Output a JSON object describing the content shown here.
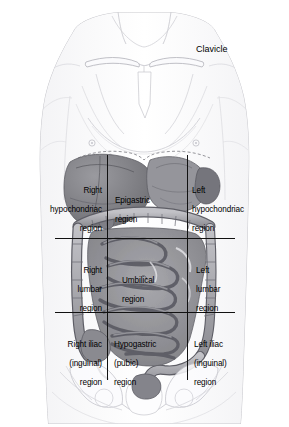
{
  "annotations": {
    "clavicle": "Clavicle"
  },
  "regions": [
    {
      "id": "right-hypochondriac",
      "line1": "Right",
      "line2": "hypochondriac",
      "line3": "region",
      "row": 1,
      "col": 1
    },
    {
      "id": "epigastric",
      "line1": "Epigastric",
      "line2": "region",
      "line3": "",
      "row": 1,
      "col": 2
    },
    {
      "id": "left-hypochondriac",
      "line1": "Left",
      "line2": "hypochondriac",
      "line3": "region",
      "row": 1,
      "col": 3
    },
    {
      "id": "right-lumbar",
      "line1": "Right",
      "line2": "lumbar",
      "line3": "region",
      "row": 2,
      "col": 1
    },
    {
      "id": "umbilical",
      "line1": "Umbilical",
      "line2": "region",
      "line3": "",
      "row": 2,
      "col": 2
    },
    {
      "id": "left-lumbar",
      "line1": "Left",
      "line2": "lumbar",
      "line3": "region",
      "row": 2,
      "col": 3
    },
    {
      "id": "right-iliac",
      "line1": "Right iliac",
      "line2": "(inguinal)",
      "line3": "region",
      "row": 3,
      "col": 1
    },
    {
      "id": "hypogastric",
      "line1": "Hypogastric",
      "line2": "(pubic)",
      "line3": "region",
      "row": 3,
      "col": 2
    },
    {
      "id": "left-iliac",
      "line1": "Left iliac",
      "line2": "(inguinal)",
      "line3": "region",
      "row": 3,
      "col": 3
    }
  ],
  "colors": {
    "background": "#ffffff",
    "gridline": "#111111",
    "body_outline": "#c9c9cd",
    "skin_fill": "#fcfcfd",
    "organ_dark": "#6e6e72",
    "organ_mid": "#8f8f94",
    "organ_light": "#b4b4b9",
    "label_text": "#000000"
  }
}
